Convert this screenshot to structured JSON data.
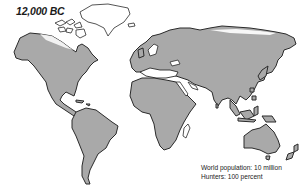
{
  "map": {
    "title": "12,000 BC",
    "caption": {
      "population": "World population: 10 million",
      "hunters": "Hunters: 100 percent"
    },
    "colors": {
      "land": "#a9a9a9",
      "outline": "#2a2a2a",
      "ice": "#ffffff",
      "background": "#ffffff"
    },
    "regions": [
      "North America",
      "Greenland",
      "South America",
      "Europe",
      "Africa",
      "Asia",
      "Indonesia",
      "Australia",
      "New Zealand",
      "Madagascar"
    ]
  }
}
